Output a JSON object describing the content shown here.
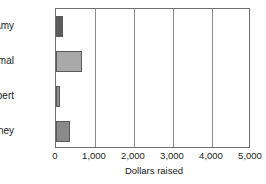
{
  "chart_data": {
    "type": "bar",
    "orientation": "horizontal",
    "title": "",
    "xlabel": "Dollars raised",
    "ylabel": "",
    "categories": [
      "Amy",
      "Jamal",
      "Robert",
      "Courtney"
    ],
    "values": [
      180,
      670,
      100,
      360
    ],
    "xlim": [
      0,
      5000
    ],
    "xticks": [
      0,
      1000,
      2000,
      3000,
      4000,
      5000
    ],
    "xtick_labels": [
      "0",
      "1,000",
      "2,000",
      "3,000",
      "4,000",
      "5,000"
    ],
    "grid": true,
    "grid_axis": "x",
    "legend": false,
    "bar_colors": [
      "#5d5d5d",
      "#a8a8a8",
      "#8f8f8f",
      "#8a8a8a"
    ],
    "bar_edge_color": "#5a5a5a",
    "frame_color": "#6e6e6e",
    "gridline_color": "#8a8a8a",
    "background_color": "#ffffff",
    "bars": [
      {
        "category": "Amy",
        "value": 180,
        "color": "#5d5d5d"
      },
      {
        "category": "Jamal",
        "value": 670,
        "color": "#a8a8a8"
      },
      {
        "category": "Robert",
        "value": 100,
        "color": "#8f8f8f"
      },
      {
        "category": "Courtney",
        "value": 360,
        "color": "#8a8a8a"
      }
    ]
  }
}
